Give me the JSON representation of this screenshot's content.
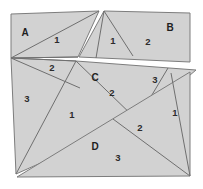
{
  "figure": {
    "canvas": {
      "width": 203,
      "height": 189
    },
    "colors": {
      "fill": "#d2d2d2",
      "stroke": "#7d7d7d",
      "cut_line": "#6f6f6f",
      "background": "#ffffff",
      "text": "#2b2b2b"
    },
    "regions": [
      {
        "id": "region-a",
        "label": "A",
        "label_pos": {
          "x": 25,
          "y": 33
        },
        "outline": "11,14 99,11 78,57 11,58",
        "cuts": [
          "11,58 99,11",
          "11,58 78,57"
        ],
        "pieces": [
          {
            "value": "1",
            "x": 57,
            "y": 40
          }
        ]
      },
      {
        "id": "region-b",
        "label": "B",
        "label_pos": {
          "x": 170,
          "y": 28
        },
        "outline": "104,11 190,13 190,62 79,57",
        "cuts": [
          "104,11 128,57"
        ],
        "pieces": [
          {
            "value": "1",
            "x": 113,
            "y": 41
          },
          {
            "value": "2",
            "x": 148,
            "y": 42
          }
        ]
      },
      {
        "id": "region-c",
        "label": "C",
        "label_pos": {
          "x": 95,
          "y": 78
        },
        "outline": "11,58 76,61 196,70 137,120 16,174",
        "cuts": [
          "11,58 76,61",
          "76,61 137,120",
          "16,174 137,120",
          "76,61 16,174"
        ],
        "pieces": [
          {
            "value": "2",
            "x": 52,
            "y": 68
          },
          {
            "value": "3",
            "x": 27,
            "y": 99
          },
          {
            "value": "2",
            "x": 112,
            "y": 93
          },
          {
            "value": "3",
            "x": 155,
            "y": 80
          },
          {
            "value": "1",
            "x": 72,
            "y": 115
          }
        ]
      },
      {
        "id": "region-d",
        "label": "D",
        "label_pos": {
          "x": 95,
          "y": 147
        },
        "outline": "190,72 190,176 17,177",
        "cuts": [
          "190,176 113,119",
          "190,176 172,72"
        ],
        "pieces": [
          {
            "value": "2",
            "x": 140,
            "y": 128
          },
          {
            "value": "1",
            "x": 175,
            "y": 113
          },
          {
            "value": "3",
            "x": 118,
            "y": 158
          }
        ]
      }
    ]
  }
}
